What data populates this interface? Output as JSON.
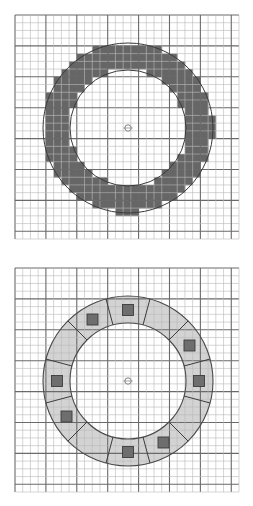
{
  "figure": {
    "type": "diagram",
    "background_color": "#ffffff",
    "width": 253,
    "height": 506
  },
  "grid": {
    "minor_step": 7.6,
    "major_every": 4,
    "minor_color": "#b9b9b9",
    "major_color": "#6a6a6a",
    "minor_width": 0.6,
    "major_width": 1.1
  },
  "panels": [
    {
      "id": "panel-top",
      "name": "rasterized-annulus-panel",
      "plot_box": {
        "x": 15,
        "y": 15,
        "w": 224,
        "h": 224
      },
      "center": {
        "cx": 128,
        "cy": 128
      },
      "center_marker": {
        "radius": 3.2,
        "fill": "#ffffff",
        "stroke": "#808080"
      },
      "annulus": {
        "outer_radius": 85,
        "inner_radius": 58,
        "fill": "#595959",
        "fill_opacity": 0.92,
        "outline_color": "#3a3a3a",
        "rasterized": true,
        "raster_cell": 7.6,
        "segments": 0,
        "squares": 0
      }
    },
    {
      "id": "panel-bottom",
      "name": "segmented-annulus-panel",
      "plot_box": {
        "x": 15,
        "y": 268,
        "w": 224,
        "h": 224
      },
      "center": {
        "cx": 128,
        "cy": 381
      },
      "center_marker": {
        "radius": 3.2,
        "fill": "#ffffff",
        "stroke": "#808080"
      },
      "annulus": {
        "outer_radius": 85,
        "inner_radius": 58,
        "fill": "#c2c2c2",
        "fill_opacity": 0.72,
        "outline_color": "#4a4a4a",
        "rasterized": false,
        "raster_cell": 7.6,
        "segments": 12,
        "segment_divider_color": "#3c3c3c",
        "squares": 8,
        "square_size": 11,
        "square_fill": "#6e6e6e",
        "square_stroke": "#3c3c3c",
        "square_radius": 71,
        "square_angles_deg": [
          90,
          120,
          150,
          180,
          210,
          240,
          270,
          300,
          330,
          0,
          30,
          60
        ],
        "square_filled_indices": [
          0,
          1,
          3,
          4,
          6,
          7,
          9,
          10
        ]
      }
    }
  ]
}
